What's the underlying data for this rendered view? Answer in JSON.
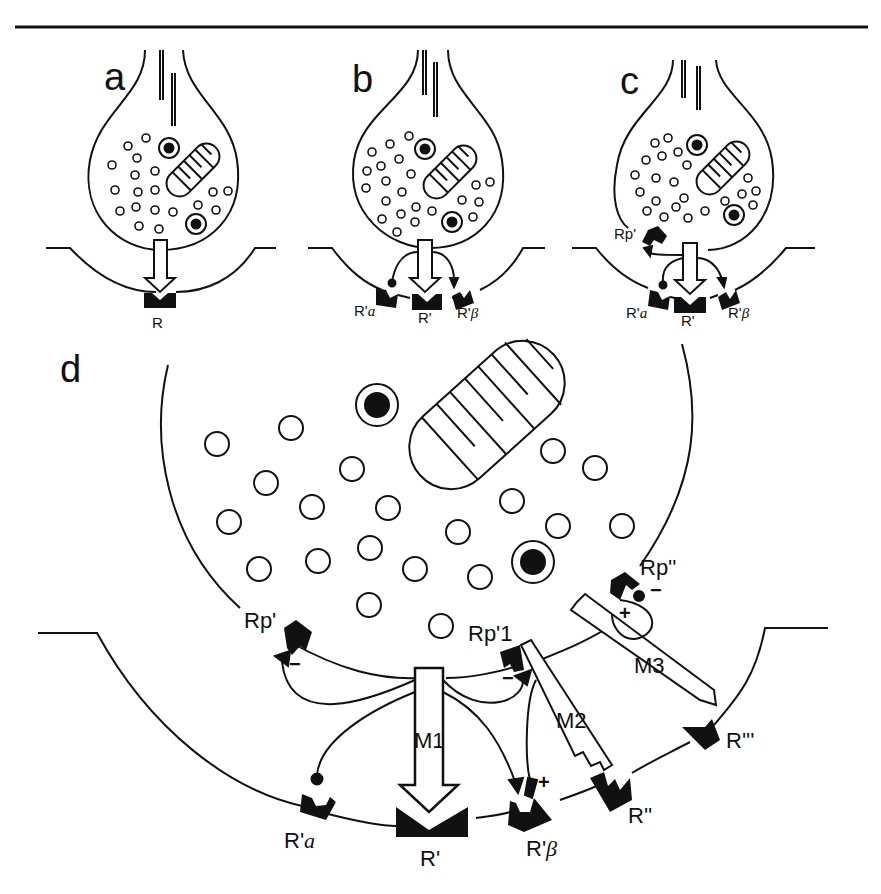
{
  "figure": {
    "panels": [
      {
        "letter": "a",
        "receptors": [
          "R"
        ]
      },
      {
        "letter": "b",
        "receptors": [
          "R'a",
          "R'",
          "R'β"
        ]
      },
      {
        "letter": "c",
        "presynaptic_receptor": "Rp'",
        "receptors": [
          "R'a",
          "R'",
          "R'β"
        ]
      },
      {
        "letter": "d",
        "presynaptic_receptors": [
          "Rp'",
          "Rp'1",
          "Rp''"
        ],
        "messengers": [
          "M1",
          "M2",
          "M3"
        ],
        "postsynaptic_receptors": [
          "R'a",
          "R'",
          "R'β",
          "R''",
          "R'''"
        ],
        "signs": {
          "rp_prime": "−",
          "rp_prime1": "−",
          "rp_dprime_minus": "−",
          "rp_dprime_plus": "+",
          "r_beta_plus": "+"
        }
      }
    ]
  },
  "labels": {
    "a": "a",
    "b": "b",
    "c": "c",
    "d": "d",
    "a_R": "R",
    "b_Ra_pre": "R'",
    "b_Ra_sub": "a",
    "b_R": "R'",
    "b_Rb_pre": "R'",
    "b_Rb_sub": "β",
    "c_Rp": "Rp'",
    "c_Ra_pre": "R'",
    "c_Ra_sub": "a",
    "c_R": "R'",
    "c_Rb_pre": "R'",
    "c_Rb_sub": "β",
    "d_Rp1": "Rp'",
    "d_Rp1b": "Rp'1",
    "d_Rp2": "Rp''",
    "d_M1": "M1",
    "d_M2": "M2",
    "d_M3": "M3",
    "d_Ra_pre": "R'",
    "d_Ra_sub": "a",
    "d_R": "R'",
    "d_Rb_pre": "R'",
    "d_Rb_sub": "β",
    "d_R2": "R''",
    "d_R3": "R'''",
    "minus": "−",
    "plus": "+"
  }
}
